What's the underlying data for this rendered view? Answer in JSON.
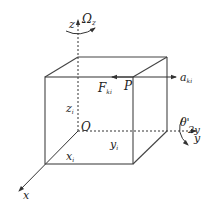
{
  "diagram": {
    "type": "3d-coordinate-cube",
    "axes": {
      "x": "x",
      "y": "y",
      "z": "z"
    },
    "origin_label": "O",
    "point_label": "P",
    "rotation_z": {
      "symbol": "Ω",
      "subscript": "z"
    },
    "rotation_y": {
      "symbol": "θ'",
      "subscript": "2y"
    },
    "force": {
      "symbol": "F",
      "subscript": "ki"
    },
    "acceleration": {
      "symbol": "a",
      "subscript": "ki"
    },
    "dimensions": {
      "x": {
        "symbol": "x",
        "subscript": "i"
      },
      "y": {
        "symbol": "y",
        "subscript": "i"
      },
      "z": {
        "symbol": "z",
        "subscript": "i"
      }
    },
    "colors": {
      "line": "#333333",
      "background": "#ffffff"
    }
  }
}
